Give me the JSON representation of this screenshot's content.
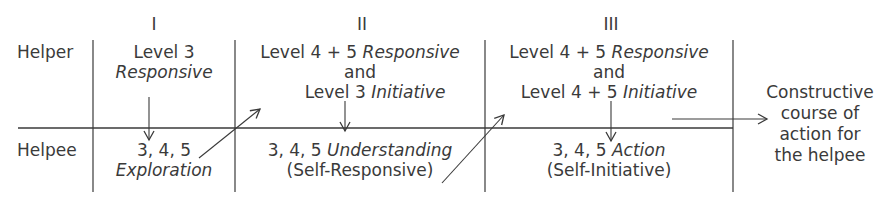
{
  "diagram": {
    "type": "helping-process-stages",
    "columns": [
      {
        "numeral": "I"
      },
      {
        "numeral": "II"
      },
      {
        "numeral": "III"
      }
    ],
    "rows": {
      "helper_label": "Helper",
      "helpee_label": "Helpee"
    },
    "helper_cells": [
      {
        "line1": "Level 3",
        "line2": "Responsive"
      },
      {
        "line1_a": "Level 4 + 5 ",
        "line1_b": "Responsive",
        "line2": "and",
        "line3_a": "Level 3 ",
        "line3_b": "Initiative"
      },
      {
        "line1_a": "Level 4 + 5 ",
        "line1_b": "Responsive",
        "line2": "and",
        "line3_a": "Level 4 + 5 ",
        "line3_b": "Initiative"
      }
    ],
    "helpee_cells": [
      {
        "line1": "3, 4, 5",
        "line2": "Exploration"
      },
      {
        "line1_a": "3, 4, 5 ",
        "line1_b": "Understanding",
        "line2": "(Self-Responsive)"
      },
      {
        "line1_a": "3, 4, 5 ",
        "line1_b": "Action",
        "line2": "(Self-Initiative)"
      }
    ],
    "outcome": {
      "line1": "Constructive",
      "line2": "course of",
      "line3": "action for",
      "line4": "the helpee"
    },
    "colors": {
      "ink": "#3a3a3a",
      "background": "#ffffff"
    }
  }
}
